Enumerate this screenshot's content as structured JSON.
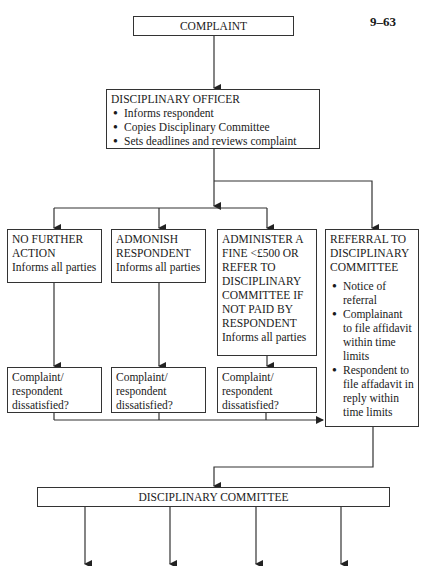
{
  "page_number": "9–63",
  "nodes": {
    "complaint": "COMPLAINT",
    "disciplinary_officer": {
      "title": "DISCIPLINARY OFFICER",
      "bullets": [
        "Informs respondent",
        "Copies Disciplinary Committee",
        "Sets deadlines and reviews complaint"
      ]
    },
    "no_further_action": {
      "title_1": "NO FURTHER",
      "title_2": "ACTION",
      "note": "Informs all parties"
    },
    "admonish": {
      "title_1": "ADMONISH",
      "title_2": "RESPONDENT",
      "note": "Informs all parties"
    },
    "fine": {
      "lines": [
        "ADMINISTER A",
        "FINE <£500 OR",
        "REFER TO",
        "DISCIPLINARY",
        "COMMITTEE IF",
        "NOT PAID BY",
        "RESPONDENT"
      ],
      "note": "Informs all parties"
    },
    "referral": {
      "lines": [
        "REFERRAL TO",
        "DISCIPLINARY",
        "COMMITTEE"
      ],
      "bullets": [
        "Notice of referral",
        "Complainant to file affidavit within time limits",
        "Respondent to file affadavit in reply within time limits"
      ]
    },
    "dissatisfied": [
      "Complaint/ respondent dissatisfied?",
      "Complaint/ respondent dissatisfied?",
      "Complaint/ respondent dissatisfied?"
    ],
    "disciplinary_committee": "DISCIPLINARY COMMITTEE"
  }
}
